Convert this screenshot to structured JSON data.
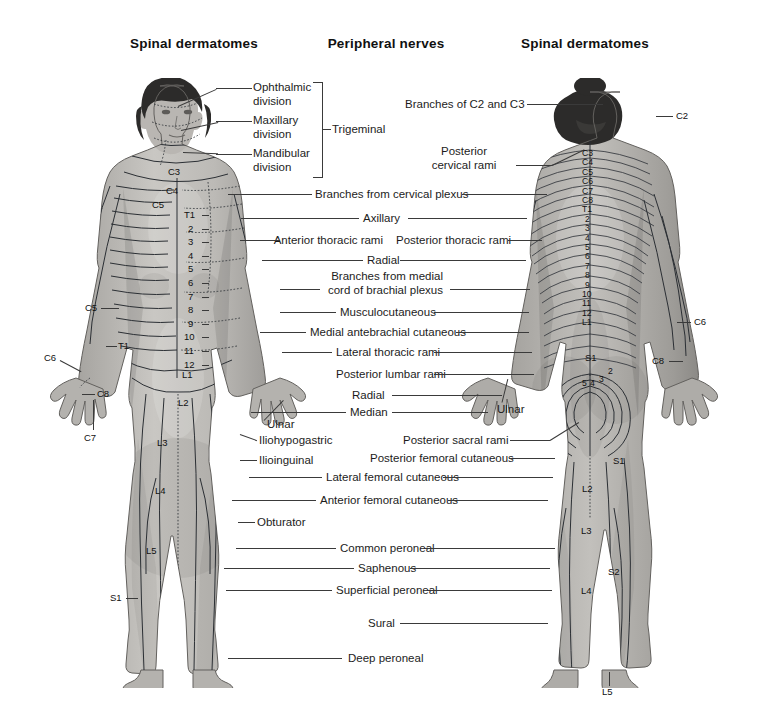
{
  "figure": {
    "type": "anatomical-chart",
    "views": [
      "anterior",
      "posterior"
    ]
  },
  "headers": {
    "left": "Spinal dermatomes",
    "center": "Peripheral nerves",
    "right": "Spinal dermatomes"
  },
  "trigeminal": {
    "group_label": "Trigeminal",
    "divisions": [
      {
        "line1": "Ophthalmic",
        "line2": "division"
      },
      {
        "line1": "Maxillary",
        "line2": "division"
      },
      {
        "line1": "Mandibular",
        "line2": "division"
      }
    ]
  },
  "center_labels": [
    {
      "text": "Branches from cervical plexus"
    },
    {
      "text": "Axillary"
    },
    {
      "text": "Anterior thoracic rami"
    },
    {
      "text": "Posterior thoracic rami"
    },
    {
      "text": "Radial"
    },
    {
      "line1": "Branches from medial",
      "line2": "cord of brachial plexus"
    },
    {
      "text": "Musculocutaneous"
    },
    {
      "text": "Medial antebrachial cutaneous"
    },
    {
      "text": "Lateral thoracic rami"
    },
    {
      "text": "Posterior lumbar rami"
    },
    {
      "text": "Radial"
    },
    {
      "text": "Median"
    },
    {
      "text": "Ulnar"
    },
    {
      "text": "Iliohypogastric"
    },
    {
      "text": "Ilioinguinal"
    },
    {
      "text": "Posterior sacral rami"
    },
    {
      "text": "Posterior femoral cutaneous"
    },
    {
      "text": "Lateral femoral cutaneous"
    },
    {
      "text": "Anterior femoral cutaneous"
    },
    {
      "text": "Obturator"
    },
    {
      "text": "Common peroneal"
    },
    {
      "text": "Saphenous"
    },
    {
      "text": "Superficial peroneal"
    },
    {
      "text": "Sural"
    },
    {
      "text": "Deep peroneal"
    }
  ],
  "labels": {
    "branches_cervical_plexus": "Branches from cervical plexus",
    "axillary": "Axillary",
    "anterior_thoracic_rami": "Anterior thoracic rami",
    "posterior_thoracic_rami": "Posterior thoracic rami",
    "radial": "Radial",
    "branches_medial_1": "Branches from medial",
    "branches_medial_2": "cord of brachial plexus",
    "musculocutaneous": "Musculocutaneous",
    "medial_antebrachial_cutaneous": "Medial antebrachial cutaneous",
    "lateral_thoracic_rami": "Lateral thoracic rami",
    "posterior_lumbar_rami": "Posterior lumbar rami",
    "radial2": "Radial",
    "median": "Median",
    "ulnar_left": "Ulnar",
    "ulnar_right": "Ulnar",
    "iliohypogastric": "Iliohypogastric",
    "ilioinguinal": "Ilioinguinal",
    "posterior_sacral_rami": "Posterior sacral rami",
    "posterior_femoral_cutaneous": "Posterior femoral cutaneous",
    "lateral_femoral_cutaneous": "Lateral femoral cutaneous",
    "anterior_femoral_cutaneous": "Anterior femoral cutaneous",
    "obturator": "Obturator",
    "common_peroneal": "Common peroneal",
    "saphenous": "Saphenous",
    "superficial_peroneal": "Superficial peroneal",
    "sural": "Sural",
    "deep_peroneal": "Deep peroneal",
    "branches_c2_c3": "Branches of C2 and C3",
    "posterior_cervical_rami_1": "Posterior",
    "posterior_cervical_rami_2": "cervical rami"
  },
  "anterior_codes": {
    "left_outer": [
      {
        "code": "C5"
      },
      {
        "code": "T1"
      },
      {
        "code": "C6"
      },
      {
        "code": "C8"
      },
      {
        "code": "C7"
      }
    ],
    "neck_chest": [
      {
        "code": "C3"
      },
      {
        "code": "C4"
      },
      {
        "code": "C5"
      }
    ],
    "thoracic": [
      "T1",
      "2",
      "3",
      "4",
      "5",
      "6",
      "7",
      "8",
      "9",
      "10",
      "11",
      "12"
    ],
    "lumbar_trunk": [
      "L1",
      "L2"
    ],
    "sacral_trunk": [
      "S1"
    ],
    "leg": [
      "L3",
      "L4",
      "L5",
      "S1"
    ]
  },
  "posterior_codes": {
    "right_outer": [
      {
        "code": "C2"
      },
      {
        "code": "C6"
      },
      {
        "code": "C8"
      }
    ],
    "spine": [
      "C3",
      "C4",
      "C5",
      "C6",
      "C7",
      "C8",
      "T1",
      "2",
      "3",
      "4",
      "5",
      "6",
      "7",
      "8",
      "9",
      "10",
      "11",
      "12",
      "L1"
    ],
    "sacral_rings": [
      "2",
      "3",
      "4",
      "5"
    ],
    "sacral_top": "S1",
    "leg": [
      "S1",
      "L2",
      "L3",
      "S2",
      "L4",
      "L5"
    ]
  },
  "colors": {
    "background": "#ffffff",
    "text": "#1a1a1a",
    "leader_line": "#3a3a3a",
    "dermatome_line": "#2b2f34",
    "skin_light": "#c8c6c3",
    "skin_mid": "#9a9894",
    "skin_dark": "#6d6b68",
    "hair": "#2c2b2a"
  }
}
